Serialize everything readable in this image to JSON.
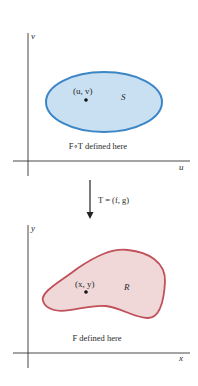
{
  "top_plot": {
    "vertical_axis_label": "v",
    "horizontal_axis_label": "u",
    "region_label": "S",
    "point_label": "(u, v)",
    "caption": "F∘T defined here",
    "stroke_color": "#3d86c6",
    "fill_color": "#c9dff2"
  },
  "mapping": {
    "label": "T = (f, g)"
  },
  "bottom_plot": {
    "vertical_axis_label": "y",
    "horizontal_axis_label": "x",
    "region_label": "R",
    "point_label": "(x, y)",
    "caption": "F defined here",
    "stroke_color": "#c0505a",
    "fill_color": "#f0d8d8"
  }
}
